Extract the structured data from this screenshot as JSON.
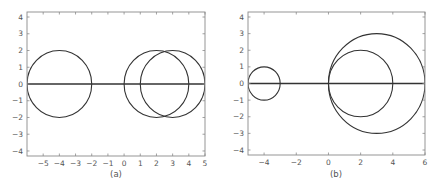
{
  "chart_data": [
    {
      "type": "line",
      "title": "",
      "caption": "(a)",
      "xlabel": "",
      "ylabel": "",
      "xlim": [
        -6,
        5
      ],
      "ylim": [
        -4.3,
        4.3
      ],
      "xticks": [
        -5,
        -4,
        -3,
        -2,
        -1,
        0,
        1,
        2,
        3,
        4,
        5
      ],
      "yticks": [
        -4,
        -3,
        -2,
        -1,
        0,
        1,
        2,
        3,
        4
      ],
      "grid": false,
      "legend": null,
      "series": [
        {
          "name": "real axis",
          "kind": "line",
          "x": [
            -6,
            5
          ],
          "y": [
            0,
            0
          ]
        },
        {
          "name": "circle 1",
          "kind": "circle",
          "center": [
            -4,
            0
          ],
          "radius": 2
        },
        {
          "name": "circle 2",
          "kind": "circle",
          "center": [
            2,
            0
          ],
          "radius": 2
        },
        {
          "name": "circle 3",
          "kind": "circle",
          "center": [
            3,
            0
          ],
          "radius": 2
        }
      ]
    },
    {
      "type": "line",
      "title": "",
      "caption": "(b)",
      "xlabel": "",
      "ylabel": "",
      "xlim": [
        -5,
        6
      ],
      "ylim": [
        -4.3,
        4.3
      ],
      "xticks": [
        -4,
        -2,
        0,
        2,
        4,
        6
      ],
      "yticks": [
        -4,
        -3,
        -2,
        -1,
        0,
        1,
        2,
        3,
        4
      ],
      "grid": false,
      "legend": null,
      "series": [
        {
          "name": "real axis",
          "kind": "line",
          "x": [
            -5,
            6
          ],
          "y": [
            0,
            0
          ]
        },
        {
          "name": "circle 1",
          "kind": "circle",
          "center": [
            -4,
            0
          ],
          "radius": 1
        },
        {
          "name": "circle 2",
          "kind": "circle",
          "center": [
            2,
            0
          ],
          "radius": 2
        },
        {
          "name": "circle 3",
          "kind": "circle",
          "center": [
            3,
            0
          ],
          "radius": 3
        }
      ]
    }
  ],
  "panels": [
    {
      "caption": "(a)"
    },
    {
      "caption": "(b)"
    }
  ]
}
